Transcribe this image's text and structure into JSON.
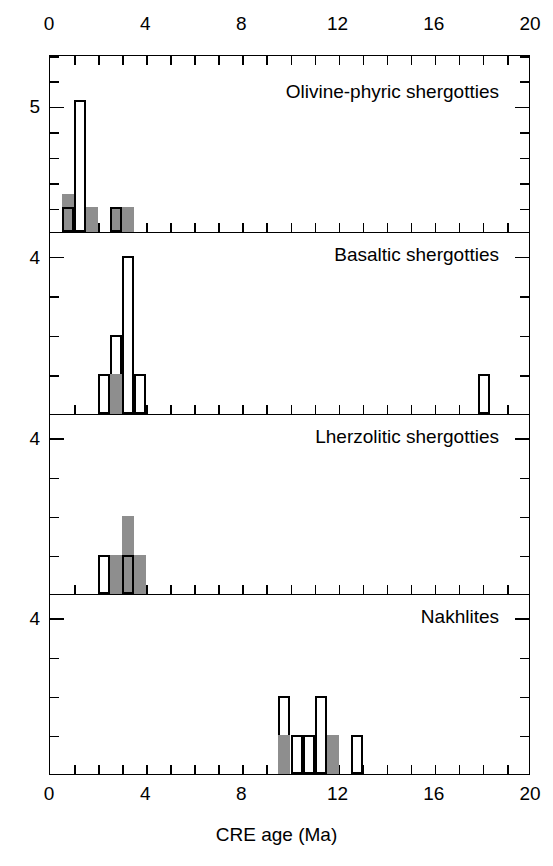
{
  "figure": {
    "xlabel": "CRE age (Ma)",
    "x_axis": {
      "min": 0,
      "max": 20,
      "ticks_major": [
        0,
        4,
        8,
        12,
        16,
        20
      ],
      "tick_step_minor": 1,
      "tick_labels": [
        "0",
        "4",
        "8",
        "12",
        "16",
        "20"
      ]
    },
    "bin_width": 0.5,
    "colors": {
      "bar_fill_gray": "#8e8e8e",
      "bar_fill_white": "#ffffff",
      "stroke": "#000000"
    }
  },
  "panels": [
    {
      "caption": "Olivine-phyric shergotties",
      "y_max": 7,
      "y_tick_labels": [
        {
          "value": 5,
          "text": "5"
        }
      ],
      "bars": [
        {
          "x0": 0.5,
          "x1": 1.0,
          "height": 1.5,
          "style": "plain-gray"
        },
        {
          "x0": 0.5,
          "x1": 1.0,
          "height": 1.0,
          "style": "filled-outline"
        },
        {
          "x0": 1.0,
          "x1": 1.5,
          "height": 5.2,
          "style": "outline"
        },
        {
          "x0": 1.5,
          "x1": 2.0,
          "height": 1.0,
          "style": "plain-gray"
        },
        {
          "x0": 2.5,
          "x1": 3.0,
          "height": 1.0,
          "style": "filled-outline"
        },
        {
          "x0": 3.0,
          "x1": 3.5,
          "height": 1.0,
          "style": "plain-gray"
        }
      ]
    },
    {
      "caption": "Basaltic shergotties",
      "y_max": 4.6,
      "y_tick_labels": [
        {
          "value": 4,
          "text": "4"
        }
      ],
      "bars": [
        {
          "x0": 2.0,
          "x1": 2.5,
          "height": 1.0,
          "style": "outline"
        },
        {
          "x0": 2.5,
          "x1": 3.0,
          "height": 2.0,
          "style": "outline"
        },
        {
          "x0": 2.5,
          "x1": 3.0,
          "height": 1.0,
          "style": "filled"
        },
        {
          "x0": 3.0,
          "x1": 3.5,
          "height": 4.0,
          "style": "outline"
        },
        {
          "x0": 3.5,
          "x1": 4.0,
          "height": 1.0,
          "style": "outline"
        },
        {
          "x0": 17.8,
          "x1": 18.3,
          "height": 1.0,
          "style": "outline"
        }
      ]
    },
    {
      "caption": "Lherzolitic shergotties",
      "y_max": 4.6,
      "y_tick_labels": [
        {
          "value": 4,
          "text": "4"
        }
      ],
      "bars": [
        {
          "x0": 2.0,
          "x1": 2.5,
          "height": 1.0,
          "style": "outline"
        },
        {
          "x0": 2.5,
          "x1": 3.0,
          "height": 1.0,
          "style": "plain-gray"
        },
        {
          "x0": 3.0,
          "x1": 3.5,
          "height": 2.0,
          "style": "plain-gray"
        },
        {
          "x0": 3.0,
          "x1": 3.5,
          "height": 1.0,
          "style": "filled-outline"
        },
        {
          "x0": 3.5,
          "x1": 4.0,
          "height": 1.0,
          "style": "plain-gray"
        }
      ]
    },
    {
      "caption": "Nakhlites",
      "y_max": 4.6,
      "y_tick_labels": [
        {
          "value": 4,
          "text": "4"
        }
      ],
      "bars": [
        {
          "x0": 9.5,
          "x1": 10.0,
          "height": 2.0,
          "style": "outline"
        },
        {
          "x0": 9.5,
          "x1": 10.0,
          "height": 1.0,
          "style": "filled"
        },
        {
          "x0": 10.0,
          "x1": 10.5,
          "height": 1.0,
          "style": "outline"
        },
        {
          "x0": 10.5,
          "x1": 11.0,
          "height": 1.0,
          "style": "outline"
        },
        {
          "x0": 11.0,
          "x1": 11.5,
          "height": 2.0,
          "style": "outline"
        },
        {
          "x0": 11.5,
          "x1": 12.0,
          "height": 1.0,
          "style": "filled"
        },
        {
          "x0": 12.5,
          "x1": 13.0,
          "height": 1.0,
          "style": "outline"
        }
      ]
    }
  ],
  "chart_data": {
    "type": "bar",
    "title": "",
    "subtitle": "",
    "xlabel": "CRE age (Ma)",
    "ylabel": "",
    "xlim": [
      0,
      20
    ],
    "grid": false,
    "legend": "none",
    "bin_width": 0.5,
    "annotations": [
      "Olivine-phyric shergotties",
      "Basaltic shergotties",
      "Lherzolitic shergotties",
      "Nakhlites"
    ],
    "panels": [
      {
        "name": "Olivine-phyric shergotties",
        "ylim": [
          0,
          7
        ],
        "yticks_labeled": [
          5
        ],
        "bins": [
          {
            "bin_start": 0.5,
            "bin_end": 1.0,
            "total": 1.5,
            "shaded": 1.5,
            "open": 0
          },
          {
            "bin_start": 1.0,
            "bin_end": 1.5,
            "total": 5.2,
            "shaded": 0,
            "open": 5.2
          },
          {
            "bin_start": 1.5,
            "bin_end": 2.0,
            "total": 1.0,
            "shaded": 1.0,
            "open": 0
          },
          {
            "bin_start": 2.5,
            "bin_end": 3.0,
            "total": 1.0,
            "shaded": 1.0,
            "open": 0
          },
          {
            "bin_start": 3.0,
            "bin_end": 3.5,
            "total": 1.0,
            "shaded": 1.0,
            "open": 0
          }
        ]
      },
      {
        "name": "Basaltic shergotties",
        "ylim": [
          0,
          4.6
        ],
        "yticks_labeled": [
          4
        ],
        "bins": [
          {
            "bin_start": 2.0,
            "bin_end": 2.5,
            "total": 1.0,
            "shaded": 0,
            "open": 1.0
          },
          {
            "bin_start": 2.5,
            "bin_end": 3.0,
            "total": 2.0,
            "shaded": 1.0,
            "open": 1.0
          },
          {
            "bin_start": 3.0,
            "bin_end": 3.5,
            "total": 4.0,
            "shaded": 0,
            "open": 4.0
          },
          {
            "bin_start": 3.5,
            "bin_end": 4.0,
            "total": 1.0,
            "shaded": 0,
            "open": 1.0
          },
          {
            "bin_start": 17.8,
            "bin_end": 18.3,
            "total": 1.0,
            "shaded": 0,
            "open": 1.0
          }
        ]
      },
      {
        "name": "Lherzolitic shergotties",
        "ylim": [
          0,
          4.6
        ],
        "yticks_labeled": [
          4
        ],
        "bins": [
          {
            "bin_start": 2.0,
            "bin_end": 2.5,
            "total": 1.0,
            "shaded": 0,
            "open": 1.0
          },
          {
            "bin_start": 2.5,
            "bin_end": 3.0,
            "total": 1.0,
            "shaded": 1.0,
            "open": 0
          },
          {
            "bin_start": 3.0,
            "bin_end": 3.5,
            "total": 2.0,
            "shaded": 2.0,
            "open": 0
          },
          {
            "bin_start": 3.5,
            "bin_end": 4.0,
            "total": 1.0,
            "shaded": 1.0,
            "open": 0
          }
        ]
      },
      {
        "name": "Nakhlites",
        "ylim": [
          0,
          4.6
        ],
        "yticks_labeled": [
          4
        ],
        "bins": [
          {
            "bin_start": 9.5,
            "bin_end": 10.0,
            "total": 2.0,
            "shaded": 1.0,
            "open": 1.0
          },
          {
            "bin_start": 10.0,
            "bin_end": 10.5,
            "total": 1.0,
            "shaded": 0,
            "open": 1.0
          },
          {
            "bin_start": 10.5,
            "bin_end": 11.0,
            "total": 1.0,
            "shaded": 0,
            "open": 1.0
          },
          {
            "bin_start": 11.0,
            "bin_end": 11.5,
            "total": 2.0,
            "shaded": 0,
            "open": 2.0
          },
          {
            "bin_start": 11.5,
            "bin_end": 12.0,
            "total": 1.0,
            "shaded": 1.0,
            "open": 0
          },
          {
            "bin_start": 12.5,
            "bin_end": 13.0,
            "total": 1.0,
            "shaded": 0,
            "open": 1.0
          }
        ]
      }
    ]
  }
}
